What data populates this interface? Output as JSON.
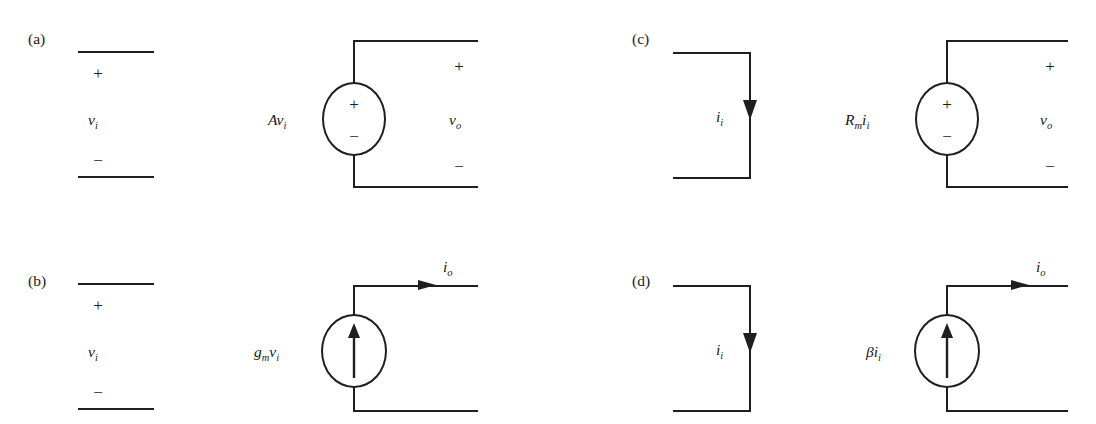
{
  "figure": {
    "background": "#ffffff",
    "line_color": "#1f1f1f",
    "width": 1096,
    "height": 424
  },
  "panels": [
    {
      "id": "a",
      "label": "(a)",
      "model": "voltage-amplifier",
      "source_type": "dependent-voltage-source",
      "source_label": "Av",
      "source_label_sub": "i",
      "source_plus": "+",
      "source_minus": "−",
      "input": {
        "label": "v",
        "label_sub": "i",
        "plus": "+",
        "minus": "−"
      },
      "output": {
        "label": "v",
        "label_sub": "o",
        "plus": "+",
        "minus": "−"
      },
      "input_arrow": null,
      "output_arrow": null
    },
    {
      "id": "b",
      "label": "(b)",
      "model": "transconductance-amplifier",
      "source_type": "dependent-current-source",
      "source_label": "g",
      "source_label_sub": "m",
      "source_label_tail": "v",
      "source_label_tail_sub": "i",
      "source_arrow_direction": "up",
      "input": {
        "label": "v",
        "label_sub": "i",
        "plus": "+",
        "minus": "−"
      },
      "output": {
        "label": "i",
        "label_sub": "o",
        "arrow_direction": "right"
      }
    },
    {
      "id": "c",
      "label": "(c)",
      "model": "transresistance-amplifier",
      "source_type": "dependent-voltage-source",
      "source_label": "R",
      "source_label_sub": "m",
      "source_label_tail": "i",
      "source_label_tail_sub": "i",
      "source_plus": "+",
      "source_minus": "−",
      "input": {
        "label": "i",
        "label_sub": "i",
        "arrow_direction": "down"
      },
      "output": {
        "label": "v",
        "label_sub": "o",
        "plus": "+",
        "minus": "−"
      }
    },
    {
      "id": "d",
      "label": "(d)",
      "model": "current-amplifier",
      "source_type": "dependent-current-source",
      "source_label": "βi",
      "source_label_sub": "i",
      "source_arrow_direction": "up",
      "input": {
        "label": "i",
        "label_sub": "i",
        "arrow_direction": "down"
      },
      "output": {
        "label": "i",
        "label_sub": "o",
        "arrow_direction": "right"
      }
    }
  ]
}
